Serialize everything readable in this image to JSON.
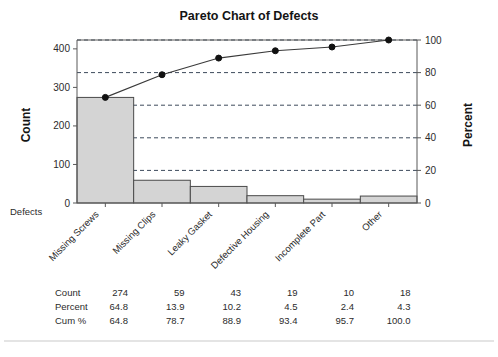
{
  "chart_data": {
    "type": "bar",
    "title": "Pareto Chart of Defects",
    "xlabel": "Defects",
    "ylabel": "Count",
    "y2label": "Percent",
    "categories": [
      "Missing Screws",
      "Missing Clips",
      "Leaky Gasket",
      "Defective Housing",
      "Incomplete Part",
      "Other"
    ],
    "values": [
      274,
      59,
      43,
      19,
      10,
      18
    ],
    "series": [
      {
        "name": "Count",
        "values": [
          274,
          59,
          43,
          19,
          10,
          18
        ]
      },
      {
        "name": "Cum %",
        "values": [
          64.8,
          78.7,
          88.9,
          93.4,
          95.7,
          100.0
        ]
      }
    ],
    "percent": [
      64.8,
      13.9,
      10.2,
      4.5,
      2.4,
      4.3
    ],
    "cum_percent": [
      64.8,
      78.7,
      88.9,
      93.4,
      95.7,
      100.0
    ],
    "ylim": [
      0,
      423
    ],
    "y2lim": [
      0,
      100
    ],
    "yticks": [
      0,
      100,
      200,
      300,
      400
    ],
    "y2ticks": [
      0,
      20,
      40,
      60,
      80,
      100
    ],
    "ytick_labels": [
      "0",
      "100",
      "200",
      "300",
      "400"
    ],
    "y2tick_labels": [
      "0",
      "20",
      "40",
      "60",
      "80",
      "100"
    ],
    "grid": true,
    "grid_axis": "percent",
    "legend": "none",
    "total": 423
  },
  "table": {
    "rows": [
      {
        "header": "Count",
        "cells": [
          "274",
          "59",
          "43",
          "19",
          "10",
          "18"
        ]
      },
      {
        "header": "Percent",
        "cells": [
          "64.8",
          "13.9",
          "10.2",
          "4.5",
          "2.4",
          "4.3"
        ]
      },
      {
        "header": "Cum %",
        "cells": [
          "64.8",
          "78.7",
          "88.9",
          "93.4",
          "95.7",
          "100.0"
        ]
      }
    ]
  },
  "colors": {
    "bar_fill": "#d4d4d4",
    "bar_stroke": "#4a4a4a",
    "line": "#3a3a3a",
    "marker": "#111111",
    "grid": "#3d4a5c",
    "frame": "#595959",
    "text": "#2b2b2b"
  }
}
